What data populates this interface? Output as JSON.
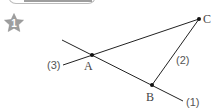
{
  "problem": {
    "number_badge": "1",
    "badge_color": "#9e9e9e"
  },
  "diagram": {
    "points": [
      {
        "name": "A",
        "x": 92,
        "y": 55
      },
      {
        "name": "B",
        "x": 152,
        "y": 85
      },
      {
        "name": "C",
        "x": 199,
        "y": 19
      }
    ],
    "lines": [
      {
        "label": "(1)",
        "desc": "line through A and B"
      },
      {
        "label": "(2)",
        "desc": "segment BC"
      },
      {
        "label": "(3)",
        "desc": "line through A and C"
      }
    ],
    "labels": {
      "A": "A",
      "B": "B",
      "C": "C",
      "line1": "(1)",
      "line2": "(2)",
      "line3": "(3)"
    }
  }
}
